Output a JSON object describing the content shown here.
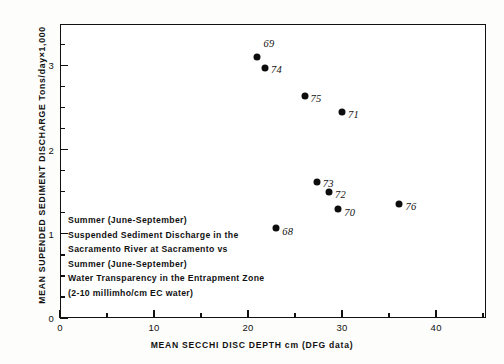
{
  "chart_data": {
    "type": "scatter",
    "title": "",
    "xlabel": "MEAN SECCHI DISC DEPTH cm (DFG data)",
    "ylabel": "MEAN SUPENDED SEDIMENT DISCHARGE Tons/day×1,000",
    "xlim": [
      0,
      45.3
    ],
    "ylim": [
      0,
      3.49
    ],
    "grid": false,
    "legend": "none",
    "xticks": [
      0,
      10,
      20,
      30,
      40
    ],
    "xticklabels": [
      "0",
      "10",
      "20",
      "30",
      "40"
    ],
    "xminorticks": [
      5,
      15,
      25,
      35,
      45
    ],
    "yticks": [
      0,
      1,
      2,
      3
    ],
    "yticklabels": [
      "0",
      "1",
      "2",
      "3"
    ],
    "yminorticks": [
      0.25,
      0.5,
      0.75,
      1.25,
      1.5,
      1.75,
      2.25,
      2.5,
      2.75,
      3.25
    ],
    "point_color": "#0d0d0d",
    "points": [
      {
        "label": "69",
        "x": 21.0,
        "y": 3.1,
        "lx": 6,
        "ly": -13
      },
      {
        "label": "74",
        "x": 21.8,
        "y": 2.97,
        "lx": 6,
        "ly": 2
      },
      {
        "label": "75",
        "x": 26.0,
        "y": 2.63,
        "lx": 6,
        "ly": 3
      },
      {
        "label": "71",
        "x": 30.0,
        "y": 2.44,
        "lx": 6,
        "ly": 3
      },
      {
        "label": "73",
        "x": 27.3,
        "y": 1.62,
        "lx": 6,
        "ly": 2
      },
      {
        "label": "72",
        "x": 28.6,
        "y": 1.5,
        "lx": 6,
        "ly": 3
      },
      {
        "label": "70",
        "x": 29.6,
        "y": 1.29,
        "lx": 6,
        "ly": 4
      },
      {
        "label": "76",
        "x": 36.1,
        "y": 1.35,
        "lx": 6,
        "ly": 3
      },
      {
        "label": "68",
        "x": 23.0,
        "y": 1.07,
        "lx": 6,
        "ly": 4
      }
    ]
  },
  "annotation": {
    "lines": [
      "Summer (June-September)",
      "Suspended Sediment Discharge in the",
      "Sacramento River at Sacramento vs",
      "Summer (June-September)",
      "Water Transparency in the Entrapment Zone",
      "(2-10 millimho/cm EC water)"
    ]
  }
}
